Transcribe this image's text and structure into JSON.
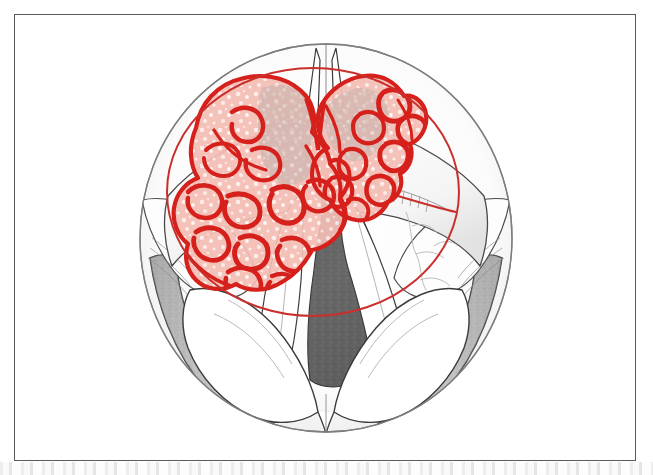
{
  "figure": {
    "title": "Laryngoscopic view of the larynx with vocal cord tumor and planned resection margin",
    "view_type": "indirect laryngoscopy / mirror view",
    "border_color": "#5a5a5a",
    "background_color": "#ffffff"
  },
  "colors": {
    "outline_dark": "#3a3a3a",
    "outline_mid": "#6e6e6e",
    "outline_light": "#9a9a9a",
    "tumor_red_bright": "#d6201c",
    "tumor_red_line": "#cf2a22",
    "tumor_pink_fill": "#f2b6ad",
    "tumor_pink_pale": "#f8d9d3",
    "tumor_gray_pink": "#c9b2ad",
    "resection_line": "#c9302c",
    "glottis_dark": "#5e5e5e",
    "glottis_darker": "#4d4d4d",
    "shadow_gray": "#b4b4b4",
    "shadow_gray_light": "#d2d2d2",
    "mucosa_white": "#fdfdfd",
    "scan_band_gray": "#c8c8c8"
  },
  "anatomy": {
    "structures": [
      {
        "id": "laryngeal-aperture-outline",
        "label": "Laryngeal inlet outline (oval field of view)"
      },
      {
        "id": "epiglottis-petiole",
        "label": "Petiole of epiglottis"
      },
      {
        "id": "anterior-commissure",
        "label": "Anterior commissure"
      },
      {
        "id": "left-vocal-cord",
        "label": "Left true vocal cord"
      },
      {
        "id": "right-vocal-cord",
        "label": "Right true vocal cord"
      },
      {
        "id": "ventricular-band-left",
        "label": "Left false cord / ventricular band"
      },
      {
        "id": "ventricular-band-right",
        "label": "Right false cord / ventricular band"
      },
      {
        "id": "glottic-airway",
        "label": "Glottic airway (rima glottidis)"
      },
      {
        "id": "arytenoid-left",
        "label": "Left arytenoid eminence"
      },
      {
        "id": "arytenoid-right",
        "label": "Right arytenoid eminence"
      },
      {
        "id": "pyriform-sinus-left",
        "label": "Left pyriform sinus (shaded)"
      },
      {
        "id": "pyriform-sinus-right",
        "label": "Right pyriform sinus (shaded)"
      },
      {
        "id": "interarytenoid-notch",
        "label": "Interarytenoid notch"
      },
      {
        "id": "aryepiglottic-fold-left",
        "label": "Left aryepiglottic fold"
      },
      {
        "id": "aryepiglottic-fold-right",
        "label": "Right aryepiglottic fold"
      },
      {
        "id": "mucosal-vessels",
        "label": "Submucosal vascular markings"
      }
    ]
  },
  "lesion": {
    "name": "Exophytic vocal cord carcinoma",
    "shape_description": "bilobed / butterfly-shaped verrucous mass crossing the anterior commissure",
    "surface_description": "irregular convoluted cerebriform surface",
    "dominant_side": "left",
    "crosses_midline": true,
    "outline_color": "#d6201c",
    "fill_color": "#f2b6ad",
    "highlight_color": "#ffffff",
    "extent": {
      "left_px": 188,
      "top_px": 72,
      "right_px": 414,
      "bottom_px": 300
    }
  },
  "resection_margin": {
    "name": "Planned resection margin",
    "shape": "circle",
    "color": "#c9302c",
    "stroke_width_px": 2,
    "center_x_px": 313,
    "center_y_px": 192,
    "radius_x_px": 146,
    "radius_y_px": 124
  },
  "field": {
    "oval_center_x_px": 326,
    "oval_center_y_px": 238,
    "oval_radius_x_px": 186,
    "oval_radius_y_px": 194
  }
}
